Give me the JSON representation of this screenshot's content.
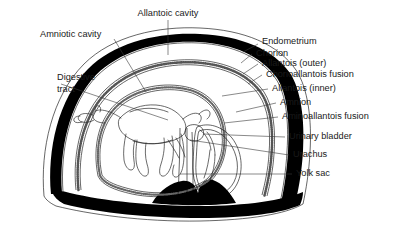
{
  "figure": {
    "background": "#ffffff",
    "ink_color": "#000000",
    "label_color": "#1a1a1a"
  },
  "labels": {
    "allantoic_cavity": "Allantoic cavity",
    "amniotic_cavity": "Amniotic cavity",
    "digestive_tract_line1": "Digestive",
    "digestive_tract_line2": "tract",
    "endometrium": "Endometrium",
    "chorion": "Chorion",
    "allantois_outer": "Allantois (outer)",
    "chorioallantois_fusion": "Chorioallantois fusion",
    "allantois_inner": "Allantois (inner)",
    "amnion": "Amnion",
    "aminoallantois_fusion": "Aminoallantois fusion",
    "urinary_bladder": "Urinary bladder",
    "urachus": "Urachus",
    "yolk_sac": "Yolk sac"
  },
  "label_list": [
    {
      "id": "allantoic-cavity",
      "text": "Allantoic cavity",
      "side": "top"
    },
    {
      "id": "amniotic-cavity",
      "text": "Amniotic cavity",
      "side": "top-left"
    },
    {
      "id": "digestive-tract",
      "text": "Digestive tract",
      "side": "left"
    },
    {
      "id": "endometrium",
      "text": "Endometrium",
      "side": "right"
    },
    {
      "id": "chorion",
      "text": "Chorion",
      "side": "right"
    },
    {
      "id": "allantois-outer",
      "text": "Allantois (outer)",
      "side": "right"
    },
    {
      "id": "chorioallantois-fusion",
      "text": "Chorioallantois fusion",
      "side": "right"
    },
    {
      "id": "allantois-inner",
      "text": "Allantois (inner)",
      "side": "right"
    },
    {
      "id": "amnion",
      "text": "Amnion",
      "side": "right"
    },
    {
      "id": "aminoallantois-fusion",
      "text": "Aminoallantois fusion",
      "side": "right"
    },
    {
      "id": "urinary-bladder",
      "text": "Urinary bladder",
      "side": "right"
    },
    {
      "id": "urachus",
      "text": "Urachus",
      "side": "right"
    },
    {
      "id": "yolk-sac",
      "text": "Yolk sac",
      "side": "right"
    }
  ]
}
